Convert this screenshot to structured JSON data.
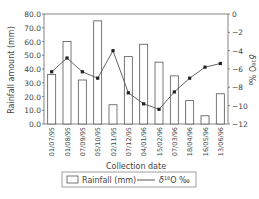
{
  "chart_data": {
    "type": "bar+line",
    "title": "",
    "xlabel": "Collection date",
    "ylabel": "Rainfall amount (mm)",
    "y2label": "δ18O ‰",
    "categories": [
      "01/07/95",
      "01/08/95",
      "07/09/95",
      "05/10/95",
      "02/11/95",
      "07/12/95",
      "04/01/96",
      "15/02/96",
      "07/03/96",
      "18/04/96",
      "16/05/96",
      "13/06/96"
    ],
    "series": [
      {
        "name": "Rainfall (mm)",
        "type": "bar",
        "axis": "left",
        "values": [
          36,
          60,
          32,
          75,
          14,
          49,
          58,
          45,
          35,
          17,
          6,
          22
        ]
      },
      {
        "name": "δ18O ‰",
        "type": "line",
        "axis": "right",
        "values": [
          -6.3,
          -4.8,
          -6.3,
          -7.0,
          -4.0,
          -8.6,
          -9.8,
          -10.4,
          -8.5,
          -7.0,
          -5.8,
          -5.4
        ]
      }
    ],
    "ylim": [
      0,
      80
    ],
    "y2lim": [
      -12,
      0
    ],
    "yticks": [
      "0.0",
      "10.0",
      "20.0",
      "30.0",
      "40.0",
      "50.0",
      "60.0",
      "70.0",
      "80.0"
    ],
    "y2ticks": [
      "0",
      "-2",
      "-4",
      "-6",
      "-8",
      "-10",
      "-12"
    ],
    "legend": {
      "position": "bottom",
      "entries": [
        "Rainfall (mm)",
        "δ18O ‰"
      ]
    },
    "grid": false
  },
  "labels": {
    "xlabel": "Collection date",
    "ylabel": "Rainfall amount (mm)",
    "y2label_prefix": "δ",
    "y2label_sup": "18",
    "y2label_suffix": "O ‰",
    "legend_bar": "Rainfall (mm)",
    "legend_line_prefix": "δ",
    "legend_line_sup": "18",
    "legend_line_suffix": "O ‰"
  },
  "colors": {
    "bar_fill": "#ffffff",
    "bar_stroke": "#555555",
    "line": "#555555",
    "marker": "#222222",
    "axis": "#666666"
  }
}
